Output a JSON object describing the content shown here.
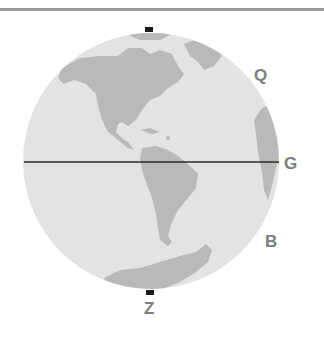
{
  "diagram": {
    "title": "",
    "globe": {
      "ocean_color": "#e3e3e3",
      "land_color": "#b9b9b9",
      "equator_color": "#2b2b2b",
      "pole_marker_color": "#1a1a1a"
    },
    "labels": [
      {
        "id": "Q",
        "text": "Q"
      },
      {
        "id": "G",
        "text": "G"
      },
      {
        "id": "B",
        "text": "B"
      },
      {
        "id": "Z",
        "text": "Z"
      }
    ]
  }
}
